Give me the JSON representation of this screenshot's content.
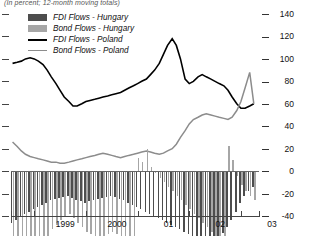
{
  "subtitle": "(In percent; 12-month moving totals)",
  "legend": [
    {
      "label": "FDI Flows - Hungary",
      "type": "swatch",
      "color": "#4d4d4d",
      "name": "legend-fdi-hungary"
    },
    {
      "label": "Bond Flows - Hungary",
      "type": "swatch",
      "color": "#a6a6a6",
      "name": "legend-bond-hungary"
    },
    {
      "label": "FDI Flows - Poland",
      "type": "line",
      "color": "#000000",
      "name": "legend-fdi-poland"
    },
    {
      "label": "Bond Flows - Poland",
      "type": "line",
      "color": "#8c8c8c",
      "name": "legend-bond-poland"
    }
  ],
  "chart_data": {
    "type": "bar",
    "title": "",
    "subtitle": "(In percent; 12-month moving totals)",
    "xlabel": "",
    "ylabel": "",
    "ylim": [
      -40,
      140
    ],
    "yticks": [
      140,
      120,
      100,
      80,
      60,
      40,
      20,
      0,
      -20,
      -40
    ],
    "grid": false,
    "legend_position": "top-left",
    "xlim": [
      1998.55,
      2003.35
    ],
    "xticks": [
      1999.0,
      2000.0,
      2001.0,
      2002.0,
      2003.0
    ],
    "xticklabels": [
      "1999",
      "2000",
      "01",
      "02",
      "03"
    ],
    "x": [
      1998.58,
      1998.67,
      1998.75,
      1998.83,
      1998.92,
      1999.0,
      1999.08,
      1999.17,
      1999.25,
      1999.33,
      1999.42,
      1999.5,
      1999.58,
      1999.67,
      1999.75,
      1999.83,
      1999.92,
      2000.0,
      2000.08,
      2000.17,
      2000.25,
      2000.33,
      2000.42,
      2000.5,
      2000.58,
      2000.67,
      2000.75,
      2000.83,
      2000.92,
      2001.0,
      2001.08,
      2001.17,
      2001.25,
      2001.33,
      2001.42,
      2001.5,
      2001.58,
      2001.67,
      2001.75,
      2001.83,
      2001.92,
      2002.0,
      2002.08,
      2002.17,
      2002.25,
      2002.33,
      2002.42,
      2002.5,
      2002.58,
      2002.67,
      2002.75,
      2002.83,
      2002.92,
      2003.0,
      2003.08,
      2003.17,
      2003.25
    ],
    "series": [
      {
        "name": "FDI Flows - Hungary",
        "kind": "bar",
        "color": "#4d4d4d",
        "values": [
          46,
          44,
          40,
          38,
          36,
          34,
          32,
          30,
          28,
          26,
          25,
          24,
          23,
          22,
          24,
          26,
          27,
          28,
          27,
          26,
          25,
          24,
          23,
          22,
          23,
          25,
          26,
          28,
          30,
          32,
          34,
          36,
          38,
          40,
          42,
          44,
          46,
          48,
          50,
          52,
          54,
          56,
          58,
          60,
          62,
          63,
          62,
          60,
          58,
          55,
          50,
          44,
          36,
          28,
          22,
          18,
          14
        ]
      },
      {
        "name": "Bond Flows - Hungary",
        "kind": "bar",
        "color": "#a6a6a6",
        "values": [
          95,
          92,
          88,
          84,
          80,
          76,
          70,
          64,
          58,
          52,
          48,
          44,
          40,
          38,
          42,
          46,
          50,
          54,
          56,
          58,
          60,
          58,
          56,
          54,
          56,
          60,
          64,
          68,
          72,
          -12,
          -8,
          -20,
          -4,
          2,
          6,
          10,
          14,
          18,
          22,
          26,
          30,
          34,
          38,
          42,
          46,
          50,
          54,
          58,
          60,
          62,
          -22,
          -10,
          4,
          12,
          18,
          22,
          26
        ]
      },
      {
        "name": "FDI Flows - Poland",
        "kind": "line",
        "color": "#000000",
        "values": [
          96,
          97,
          98,
          100,
          101,
          100,
          98,
          95,
          90,
          84,
          78,
          72,
          66,
          62,
          58,
          58,
          60,
          62,
          63,
          64,
          65,
          66,
          67,
          68,
          69,
          70,
          72,
          74,
          76,
          78,
          80,
          82,
          86,
          90,
          96,
          104,
          112,
          118,
          112,
          100,
          82,
          78,
          80,
          84,
          86,
          84,
          82,
          80,
          78,
          76,
          72,
          66,
          60,
          56,
          56,
          58,
          60
        ]
      },
      {
        "name": "Bond Flows - Poland",
        "kind": "line",
        "color": "#8c8c8c",
        "values": [
          26,
          22,
          18,
          15,
          13,
          12,
          11,
          10,
          9,
          8,
          8,
          7,
          7,
          8,
          9,
          10,
          11,
          12,
          13,
          14,
          15,
          16,
          15,
          14,
          13,
          12,
          13,
          14,
          15,
          16,
          17,
          18,
          17,
          16,
          15,
          16,
          18,
          20,
          24,
          30,
          36,
          42,
          46,
          48,
          50,
          51,
          50,
          49,
          48,
          47,
          46,
          48,
          54,
          62,
          74,
          88,
          60
        ]
      }
    ]
  }
}
